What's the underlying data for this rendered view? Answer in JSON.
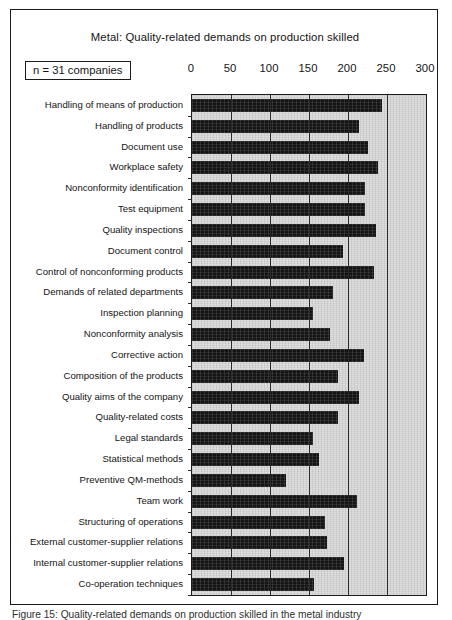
{
  "figure": {
    "title": "Metal: Quality-related demands on production skilled",
    "sample_note": "n = 31 companies",
    "caption": "Figure 15: Quality-related demands on production skilled in the metal industry"
  },
  "colors": {
    "plot_background": "#cfcfcf",
    "bar_fill": "#151515",
    "frame": "#1b1b1b",
    "gridline": "#2a2a2a",
    "page_background": "#ffffff"
  },
  "chart_data": {
    "type": "bar",
    "orientation": "horizontal",
    "title": "Metal: Quality-related demands on production skilled",
    "xlabel": "",
    "ylabel": "",
    "xlim": [
      0,
      300
    ],
    "xticks": [
      0,
      50,
      100,
      150,
      200,
      250,
      300
    ],
    "tick_labels": [
      "0",
      "50",
      "100",
      "150",
      "200",
      "250",
      "300"
    ],
    "grid": true,
    "legend": false,
    "annotations": [
      "n = 31 companies"
    ],
    "categories": [
      "Handling of means of production",
      "Handling of products",
      "Document use",
      "Workplace safety",
      "Nonconformity identification",
      "Test equipment",
      "Quality inspections",
      "Document control",
      "Control of nonconforming products",
      "Demands of related departments",
      "Inspection planning",
      "Nonconformity analysis",
      "Corrective action",
      "Composition of the  products",
      "Quality aims of the company",
      "Quality-related costs",
      "Legal standards",
      "Statistical methods",
      "Preventive QM-methods",
      "Team work",
      "Structuring of operations",
      "External customer-supplier relations",
      "Internal customer-supplier relations",
      "Co-operation techniques"
    ],
    "values": [
      243,
      214,
      225,
      239,
      222,
      222,
      236,
      194,
      233,
      181,
      155,
      177,
      221,
      187,
      214,
      187,
      155,
      163,
      121,
      212,
      170,
      173,
      195,
      157
    ]
  }
}
